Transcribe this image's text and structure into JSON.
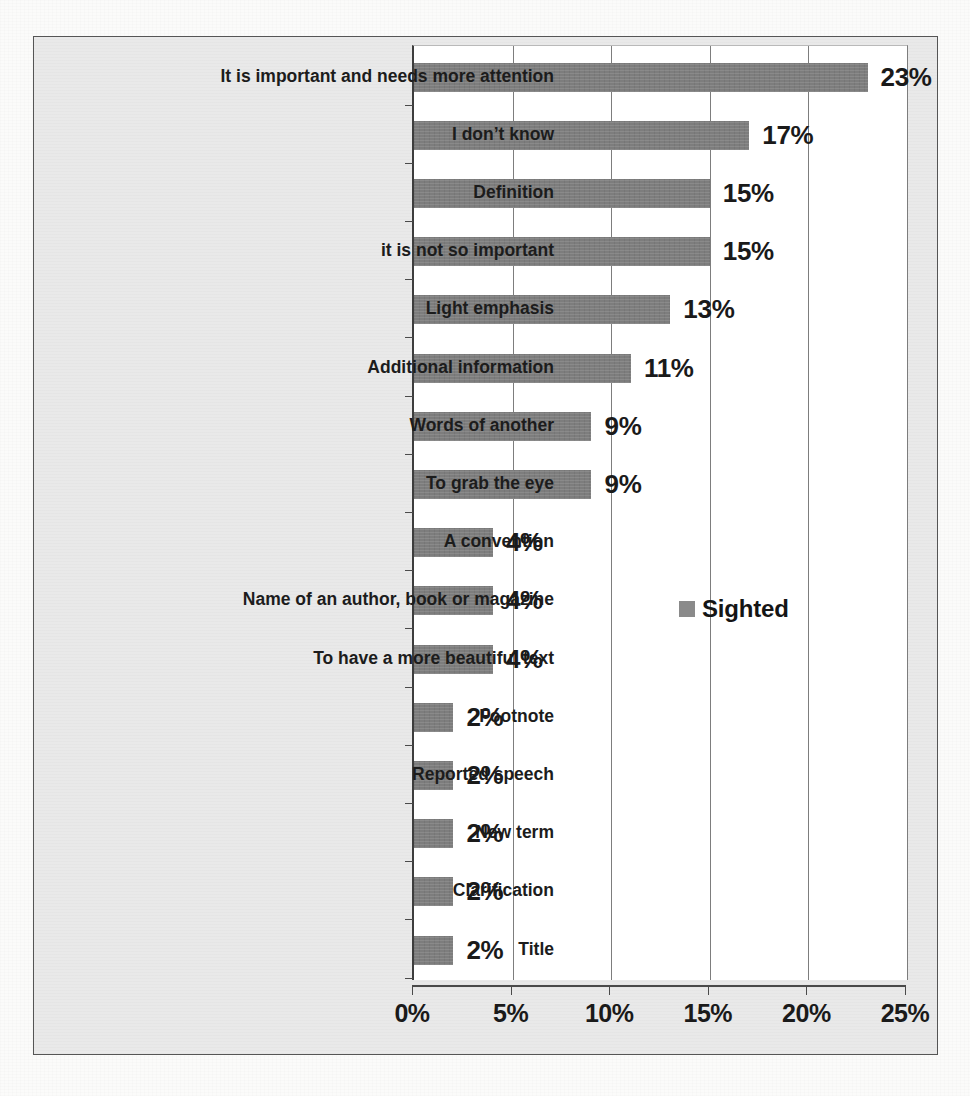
{
  "chart_data": {
    "type": "bar",
    "orientation": "horizontal",
    "title": "",
    "xlabel": "",
    "ylabel": "",
    "xlim": [
      0,
      25
    ],
    "xtick_labels": [
      "0%",
      "5%",
      "10%",
      "15%",
      "20%",
      "25%"
    ],
    "xticks": [
      0,
      5,
      10,
      15,
      20,
      25
    ],
    "grid": "vertical",
    "legend_position": "middle-right",
    "bar_color": "#7d7d7d",
    "plot_background": "#ffffff",
    "chart_background": "#e9e9e9",
    "categories": [
      "It is important and needs more attention",
      "I don’t know",
      "Definition",
      "it is not so important",
      "Light emphasis",
      "Additional information",
      "Words of another",
      "To grab the eye",
      "A convention",
      "Name of an author, book or magazine",
      "To have a more beautiful text",
      "Footnote",
      "Reported speech",
      "New term",
      "Clarification",
      "Title"
    ],
    "values": [
      23,
      17,
      15,
      15,
      13,
      11,
      9,
      9,
      4,
      4,
      4,
      2,
      2,
      2,
      2,
      2
    ],
    "value_labels": [
      "23%",
      "17%",
      "15%",
      "15%",
      "13%",
      "11%",
      "9%",
      "9%",
      "4%",
      "4%",
      "4%",
      "2%",
      "2%",
      "2%",
      "2%",
      "2%"
    ],
    "series": [
      {
        "name": "Sighted",
        "values": [
          23,
          17,
          15,
          15,
          13,
          11,
          9,
          9,
          4,
          4,
          4,
          2,
          2,
          2,
          2,
          2
        ]
      }
    ]
  },
  "legend": {
    "entries": [
      {
        "label": "Sighted",
        "color": "#8a8a8a"
      }
    ]
  }
}
